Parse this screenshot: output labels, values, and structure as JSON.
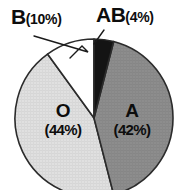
{
  "chart_data": {
    "type": "pie",
    "title": "",
    "subtitle": "",
    "xlabel": "",
    "ylabel": "",
    "grid": false,
    "legend_position": "none",
    "categories": [
      "O",
      "A",
      "B",
      "AB"
    ],
    "values": [
      44,
      42,
      10,
      4
    ],
    "value_unit": "%",
    "slices": [
      {
        "name": "AB",
        "label": "AB",
        "percent": 4,
        "percent_text": "(4%)",
        "color": "#141414",
        "label_placement": "outside",
        "start_angle_deg": 0,
        "end_angle_deg": 14.4
      },
      {
        "name": "A",
        "label": "A",
        "percent": 42,
        "percent_text": "(42%)",
        "color": "#8c8c8c",
        "label_placement": "inside",
        "start_angle_deg": 14.4,
        "end_angle_deg": 165.6
      },
      {
        "name": "O",
        "label": "O",
        "percent": 44,
        "percent_text": "(44%)",
        "color": "#dedede",
        "label_placement": "inside",
        "start_angle_deg": 165.6,
        "end_angle_deg": 324.0
      },
      {
        "name": "B",
        "label": "B",
        "percent": 10,
        "percent_text": "(10%)",
        "color": "#ffffff",
        "label_placement": "outside",
        "start_angle_deg": 324.0,
        "end_angle_deg": 360.0
      }
    ],
    "annotations": [
      {
        "name": "B-callout",
        "text": "B (10%)"
      },
      {
        "name": "AB-callout",
        "text": "AB (4%)"
      }
    ],
    "geometry": {
      "center_x": 94,
      "center_y": 118,
      "radius": 79
    },
    "colors": {
      "background": "#ffffff",
      "outline": "#2b2b2b",
      "text": "#0d0d0d"
    }
  },
  "labels": {
    "b": {
      "main": "B",
      "pct": "(10%)"
    },
    "ab": {
      "main": "AB",
      "pct": "(4%)"
    },
    "o": {
      "main": "O",
      "pct": "(44%)"
    },
    "a": {
      "main": "A",
      "pct": "(42%)"
    }
  }
}
